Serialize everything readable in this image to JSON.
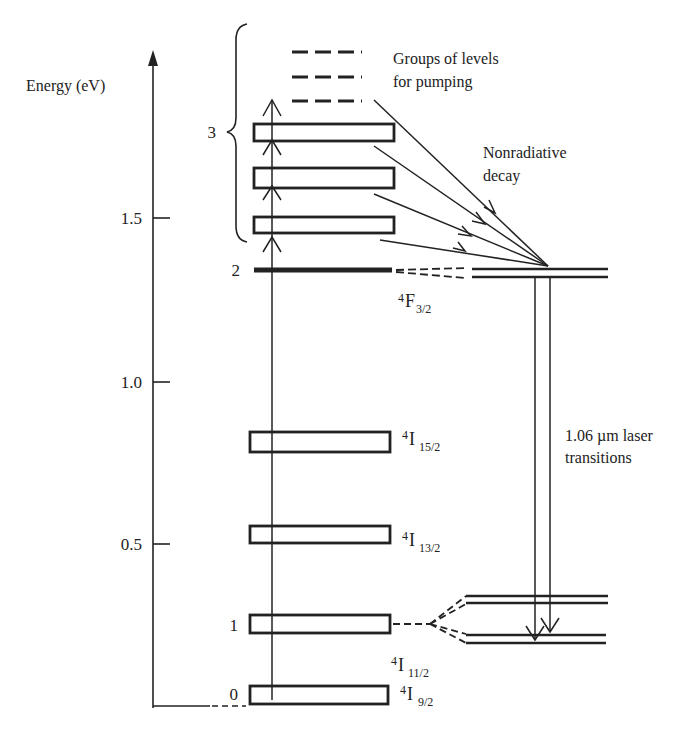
{
  "diagram": {
    "axis": {
      "label": "Energy (eV)",
      "ticks": [
        {
          "value": "1.5",
          "y": 218
        },
        {
          "value": "1.0",
          "y": 382
        },
        {
          "value": "0.5",
          "y": 544
        }
      ]
    },
    "levels": {
      "level_0": {
        "number": "0",
        "term": "4",
        "term_letter": "I",
        "term_sub": "9/2"
      },
      "level_1": {
        "number": "1",
        "term": "4",
        "term_letter": "I",
        "term_sub": "11/2"
      },
      "level_13": {
        "term": "4",
        "term_letter": "I",
        "term_sub": "13/2"
      },
      "level_15": {
        "term": "4",
        "term_letter": "I",
        "term_sub": "15/2"
      },
      "level_2": {
        "number": "2",
        "term": "4",
        "term_letter": "F",
        "term_sub": "3/2"
      },
      "level_3": {
        "number": "3"
      }
    },
    "annotations": {
      "pumping_line1": "Groups of levels",
      "pumping_line2": "for pumping",
      "decay_line1": "Nonradiative",
      "decay_line2": "decay",
      "laser_line1": "1.06 µm laser",
      "laser_line2": "transitions"
    },
    "colors": {
      "ink": "#222222",
      "background": "#ffffff"
    }
  }
}
